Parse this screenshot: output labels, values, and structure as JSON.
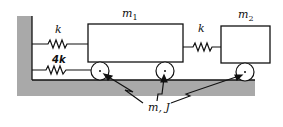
{
  "diagram": {
    "type": "mechanical-vibration-system",
    "colors": {
      "ground": "#a9a9a9",
      "line": "#111111",
      "background": "#ffffff"
    },
    "masses": [
      {
        "id": "m1",
        "label_base": "m",
        "label_sub": "1"
      },
      {
        "id": "m2",
        "label_base": "m",
        "label_sub": "2"
      }
    ],
    "springs": [
      {
        "id": "spring-wall-m1-top",
        "label": "k",
        "from": "wall",
        "to": "m1"
      },
      {
        "id": "spring-wall-m1-bottom",
        "label": "4k",
        "from": "wall",
        "to": "m1-cylinder-left"
      },
      {
        "id": "spring-m1-m2",
        "label": "k",
        "from": "m1",
        "to": "m2"
      }
    ],
    "cylinders": [
      {
        "id": "cyl-1",
        "under": "m1",
        "position": "left"
      },
      {
        "id": "cyl-2",
        "under": "m1",
        "position": "right"
      },
      {
        "id": "cyl-3",
        "under": "m2",
        "position": "center"
      }
    ],
    "cylinder_label": "m, J"
  }
}
